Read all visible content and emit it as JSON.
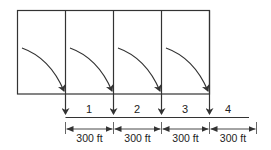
{
  "diagram": {
    "segments": [
      {
        "number": "1",
        "length_label": "300 ft"
      },
      {
        "number": "2",
        "length_label": "300 ft"
      },
      {
        "number": "3",
        "length_label": "300 ft"
      },
      {
        "number": "4",
        "length_label": "300 ft"
      }
    ],
    "colors": {
      "stroke": "#333333",
      "background": "#ffffff"
    }
  }
}
